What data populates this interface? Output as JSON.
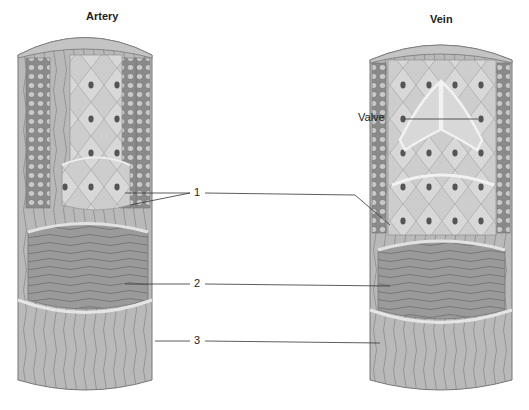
{
  "diagram": {
    "panels": [
      {
        "id": "artery",
        "title": "Artery"
      },
      {
        "id": "vein",
        "title": "Vein"
      }
    ],
    "labels": {
      "valve": "Valve",
      "layer1": "1",
      "layer2": "2",
      "layer3": "3"
    },
    "colors": {
      "background": "#ffffff",
      "outer_layer": "#b8b8b8",
      "middle_layer": "#8f8f8f",
      "inner_layer": "#c8c8c8",
      "cells": "#d4d4d4",
      "nucleus": "#555555",
      "leader_line": "#333333"
    }
  }
}
